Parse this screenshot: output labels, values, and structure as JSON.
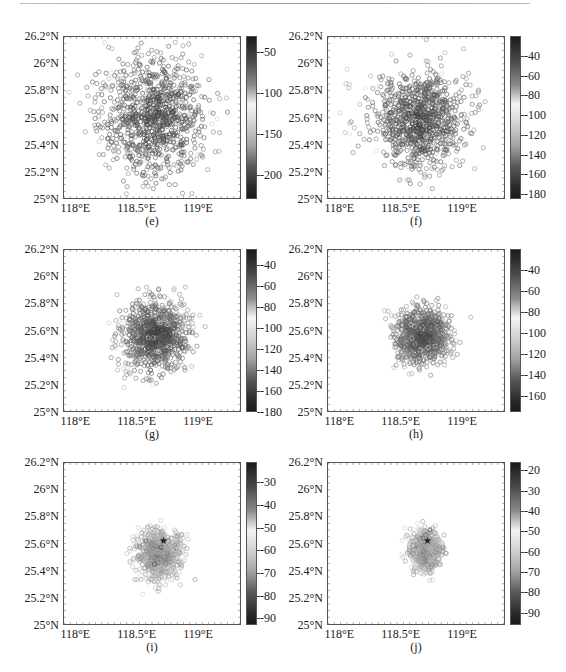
{
  "figure": {
    "panels": [
      {
        "id": "e",
        "caption": "(e)",
        "cbar_ticks": [
          "-50",
          "-100",
          "-150",
          "-200"
        ],
        "cbar_values": [
          -50,
          -100,
          -150,
          -200
        ],
        "cbar_range": [
          -30,
          -230
        ]
      },
      {
        "id": "f",
        "caption": "(f)",
        "cbar_ticks": [
          "-40",
          "-60",
          "-80",
          "-100",
          "-120",
          "-140",
          "-160",
          "-180"
        ],
        "cbar_values": [
          -40,
          -60,
          -80,
          -100,
          -120,
          -140,
          -160,
          -180
        ],
        "cbar_range": [
          -20,
          -185
        ]
      },
      {
        "id": "g",
        "caption": "(g)",
        "cbar_ticks": [
          "-40",
          "-60",
          "-80",
          "-100",
          "-120",
          "-140",
          "-160",
          "-180"
        ],
        "cbar_values": [
          -40,
          -60,
          -80,
          -100,
          -120,
          -140,
          -160,
          -180
        ],
        "cbar_range": [
          -25,
          -180
        ]
      },
      {
        "id": "h",
        "caption": "(h)",
        "cbar_ticks": [
          "-40",
          "-60",
          "-80",
          "-100",
          "-120",
          "-140",
          "-160"
        ],
        "cbar_values": [
          -40,
          -60,
          -80,
          -100,
          -120,
          -140,
          -160
        ],
        "cbar_range": [
          -20,
          -175
        ]
      },
      {
        "id": "i",
        "caption": "(i)",
        "cbar_ticks": [
          "-30",
          "-40",
          "-50",
          "-60",
          "-70",
          "-80",
          "-90"
        ],
        "cbar_values": [
          -30,
          -40,
          -50,
          -60,
          -70,
          -80,
          -90
        ],
        "cbar_range": [
          -21,
          -93
        ]
      },
      {
        "id": "j",
        "caption": "(j)",
        "cbar_ticks": [
          "-20",
          "-30",
          "-40",
          "-50",
          "-60",
          "-70",
          "-80",
          "-90"
        ],
        "cbar_values": [
          -20,
          -30,
          -40,
          -50,
          -60,
          -70,
          -80,
          -90
        ],
        "cbar_range": [
          -16,
          -96
        ]
      }
    ],
    "y_ticks": [
      "26.2°N",
      "26°N",
      "25.8°N",
      "25.6°N",
      "25.4°N",
      "25.2°N",
      "25°N"
    ],
    "x_ticks": [
      "118°E",
      "118.5°E",
      "119°E"
    ]
  },
  "chart_data": [
    {
      "type": "scatter",
      "title": "(e)",
      "xlabel": "Longitude",
      "ylabel": "Latitude",
      "xlim": [
        117.9,
        119.35
      ],
      "ylim": [
        25.0,
        26.2
      ],
      "colorbar": {
        "range": [
          -30,
          -230
        ],
        "ticks": [
          -50,
          -100,
          -150,
          -200
        ],
        "cmap": "gray-dark-light-dark"
      },
      "cluster": {
        "center": [
          118.65,
          25.6
        ],
        "spread": [
          0.28,
          0.28
        ],
        "count": 1000,
        "seed": 11
      },
      "star_marker": null
    },
    {
      "type": "scatter",
      "title": "(f)",
      "xlabel": "Longitude",
      "ylabel": "Latitude",
      "xlim": [
        117.9,
        119.35
      ],
      "ylim": [
        25.0,
        26.2
      ],
      "colorbar": {
        "range": [
          -20,
          -185
        ],
        "ticks": [
          -40,
          -60,
          -80,
          -100,
          -120,
          -140,
          -160,
          -180
        ],
        "cmap": "gray-dark-light-dark"
      },
      "cluster": {
        "center": [
          118.65,
          25.58
        ],
        "spread": [
          0.24,
          0.22
        ],
        "count": 1000,
        "seed": 23
      },
      "star_marker": null
    },
    {
      "type": "scatter",
      "title": "(g)",
      "xlabel": "Longitude",
      "ylabel": "Latitude",
      "xlim": [
        117.9,
        119.35
      ],
      "ylim": [
        25.0,
        26.2
      ],
      "colorbar": {
        "range": [
          -25,
          -180
        ],
        "ticks": [
          -40,
          -60,
          -80,
          -100,
          -120,
          -140,
          -160,
          -180
        ],
        "cmap": "gray-dark-light-dark"
      },
      "cluster": {
        "center": [
          118.65,
          25.56
        ],
        "spread": [
          0.17,
          0.16
        ],
        "count": 1000,
        "seed": 37
      },
      "star_marker": null
    },
    {
      "type": "scatter",
      "title": "(h)",
      "xlabel": "Longitude",
      "ylabel": "Latitude",
      "xlim": [
        117.9,
        119.35
      ],
      "ylim": [
        25.0,
        26.2
      ],
      "colorbar": {
        "range": [
          -20,
          -175
        ],
        "ticks": [
          -40,
          -60,
          -80,
          -100,
          -120,
          -140,
          -160
        ],
        "cmap": "gray-dark-light-dark"
      },
      "cluster": {
        "center": [
          118.68,
          25.56
        ],
        "spread": [
          0.13,
          0.12
        ],
        "count": 1000,
        "seed": 51
      },
      "star_marker": null
    },
    {
      "type": "scatter",
      "title": "(i)",
      "xlabel": "Longitude",
      "ylabel": "Latitude",
      "xlim": [
        117.9,
        119.35
      ],
      "ylim": [
        25.0,
        26.2
      ],
      "colorbar": {
        "range": [
          -21,
          -93
        ],
        "ticks": [
          -30,
          -40,
          -50,
          -60,
          -70,
          -80,
          -90
        ],
        "cmap": "gray-dark-light-dark"
      },
      "cluster": {
        "center": [
          118.68,
          25.52
        ],
        "spread": [
          0.11,
          0.11
        ],
        "count": 700,
        "seed": 67
      },
      "star_marker": {
        "lon": 118.72,
        "lat": 25.62
      }
    },
    {
      "type": "scatter",
      "title": "(j)",
      "xlabel": "Longitude",
      "ylabel": "Latitude",
      "xlim": [
        117.9,
        119.35
      ],
      "ylim": [
        25.0,
        26.2
      ],
      "colorbar": {
        "range": [
          -16,
          -96
        ],
        "ticks": [
          -20,
          -30,
          -40,
          -50,
          -60,
          -70,
          -80,
          -90
        ],
        "cmap": "gray-dark-light-dark"
      },
      "cluster": {
        "center": [
          118.7,
          25.55
        ],
        "spread": [
          0.08,
          0.09
        ],
        "count": 600,
        "seed": 79
      },
      "star_marker": {
        "lon": 118.72,
        "lat": 25.62
      }
    }
  ]
}
